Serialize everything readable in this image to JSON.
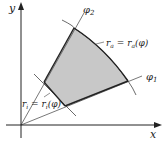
{
  "diagram": {
    "axes": {
      "x_label": "x",
      "y_label": "y"
    },
    "rays": [
      {
        "label": "φ2",
        "sub": "2"
      },
      {
        "label": "φ1",
        "sub": "1"
      }
    ],
    "curves": {
      "outer": "r_a = r_a(φ)",
      "inner": "r_i = r_i(φ)"
    },
    "labels": {
      "y": "y",
      "x": "x",
      "phi2_main": "φ",
      "phi2_sub": "2",
      "phi1_main": "φ",
      "phi1_sub": "1",
      "ra_r": "r",
      "ra_sub": "a",
      "ra_eq": " = r",
      "ra_sub2": "a",
      "ra_arg": "(φ)",
      "ri_r": "r",
      "ri_sub": "i",
      "ri_eq": " = r",
      "ri_sub2": "i",
      "ri_arg": "(φ)"
    },
    "colors": {
      "fill": "#c8c8c8",
      "line": "#333333"
    }
  }
}
